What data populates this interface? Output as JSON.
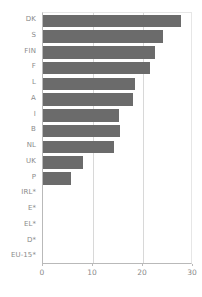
{
  "chart_data": {
    "type": "bar",
    "orientation": "horizontal",
    "title": "",
    "subtitle": "",
    "xlabel": "",
    "ylabel": "",
    "xlim": [
      0,
      30
    ],
    "ylim": null,
    "grid": true,
    "legend": null,
    "legend_position": "none",
    "bar_color": "#6b6b6b",
    "axis_color": "#b9b9b9",
    "gridline_color": "#d8d8d8",
    "xticks": [
      0,
      10,
      20,
      30
    ],
    "xtick_labels": [
      "0",
      "10",
      "20",
      "30"
    ],
    "categories": [
      "DK",
      "S",
      "FIN",
      "F",
      "L",
      "A",
      "I",
      "B",
      "NL",
      "UK",
      "P",
      "IRL*",
      "E*",
      "EL*",
      "D*",
      "EU-15*"
    ],
    "values": [
      27.6,
      24.0,
      22.4,
      21.4,
      18.4,
      18.0,
      15.2,
      15.4,
      14.2,
      8.0,
      5.6,
      null,
      null,
      null,
      null,
      null
    ],
    "missing_note": "Categories marked * have no bar (no data shown)",
    "points": [
      {
        "category": "DK",
        "value": 27.6,
        "has_bar": true
      },
      {
        "category": "S",
        "value": 24.0,
        "has_bar": true
      },
      {
        "category": "FIN",
        "value": 22.4,
        "has_bar": true
      },
      {
        "category": "F",
        "value": 21.4,
        "has_bar": true
      },
      {
        "category": "L",
        "value": 18.4,
        "has_bar": true
      },
      {
        "category": "A",
        "value": 18.0,
        "has_bar": true
      },
      {
        "category": "I",
        "value": 15.2,
        "has_bar": true
      },
      {
        "category": "B",
        "value": 15.4,
        "has_bar": true
      },
      {
        "category": "NL",
        "value": 14.2,
        "has_bar": true
      },
      {
        "category": "UK",
        "value": 8.0,
        "has_bar": true
      },
      {
        "category": "P",
        "value": 5.6,
        "has_bar": true
      },
      {
        "category": "IRL*",
        "value": null,
        "has_bar": false
      },
      {
        "category": "E*",
        "value": null,
        "has_bar": false
      },
      {
        "category": "EL*",
        "value": null,
        "has_bar": false
      },
      {
        "category": "D*",
        "value": null,
        "has_bar": false
      },
      {
        "category": "EU-15*",
        "value": null,
        "has_bar": false
      }
    ]
  }
}
